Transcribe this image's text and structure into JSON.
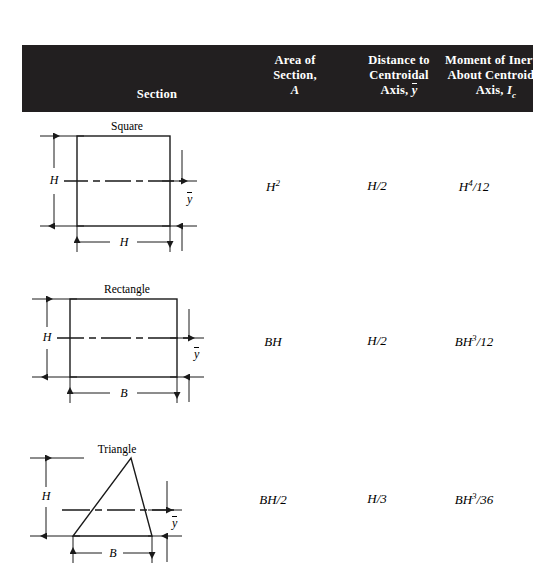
{
  "table": {
    "headers": {
      "section": "Section",
      "area": {
        "line1": "Area of",
        "line2": "Section,",
        "symbol": "A"
      },
      "distance": {
        "line1": "Distance to",
        "line2": "Centroidal",
        "line3_prefix": "Axis,",
        "symbol": "y"
      },
      "moment": {
        "line1": "Moment of Inertia",
        "line2": "About Centroidal",
        "line3_prefix": "Axis,",
        "symbol": "I",
        "subscript": "c"
      }
    },
    "header_background": "#221f20",
    "header_text_color": "#ffffff",
    "rows": [
      {
        "shape": "Square",
        "labels": {
          "height": "H",
          "width": "H",
          "centroid": "y"
        },
        "area": "H2",
        "area_base": "H",
        "area_exp": "2",
        "distance": "H/2",
        "moment_base": "H",
        "moment_exp": "4",
        "moment_denom": "/12"
      },
      {
        "shape": "Rectangle",
        "labels": {
          "height": "H",
          "width": "B",
          "centroid": "y"
        },
        "area": "BH",
        "area_base": "BH",
        "area_exp": "",
        "distance": "H/2",
        "moment_base": "BH",
        "moment_exp": "3",
        "moment_denom": "/12"
      },
      {
        "shape": "Triangle",
        "labels": {
          "height": "H",
          "width": "B",
          "centroid": "y"
        },
        "area": "BH/2",
        "area_base": "BH/2",
        "area_exp": "",
        "distance": "H/3",
        "moment_base": "BH",
        "moment_exp": "3",
        "moment_denom": "/36"
      }
    ]
  }
}
